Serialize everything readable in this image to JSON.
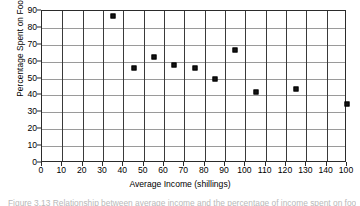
{
  "chart_data": {
    "type": "scatter",
    "title": "",
    "xlabel": "Average Income (shillings)",
    "ylabel": "Percentage Spent on Food",
    "xlim": [
      0,
      150
    ],
    "ylim": [
      0,
      90
    ],
    "grid": true,
    "legend": false,
    "xticks": [
      0,
      10,
      20,
      30,
      40,
      50,
      60,
      70,
      80,
      90,
      100,
      110,
      120,
      130,
      140,
      150
    ],
    "xtick_labels": [
      "0",
      "10",
      "20",
      "30",
      "40",
      "50",
      "60",
      "70",
      "80",
      "90",
      "100",
      "110",
      "120",
      "130",
      "140",
      "100"
    ],
    "yticks": [
      0,
      10,
      20,
      30,
      40,
      50,
      60,
      70,
      80,
      90
    ],
    "ytick_labels": [
      "0",
      "10",
      "20",
      "30",
      "40",
      "50",
      "60",
      "70",
      "80",
      "90"
    ],
    "marker": "filled-square",
    "marker_color": "#141414",
    "points": [
      {
        "x": 35,
        "y": 87
      },
      {
        "x": 45,
        "y": 56
      },
      {
        "x": 55,
        "y": 63
      },
      {
        "x": 65,
        "y": 58
      },
      {
        "x": 75,
        "y": 56
      },
      {
        "x": 85,
        "y": 50
      },
      {
        "x": 95,
        "y": 67
      },
      {
        "x": 105,
        "y": 42
      },
      {
        "x": 125,
        "y": 44
      },
      {
        "x": 150,
        "y": 35
      }
    ]
  },
  "caption": {
    "text": "Figure 3.13  Relationship between average income and the percentage of income spent on food"
  }
}
